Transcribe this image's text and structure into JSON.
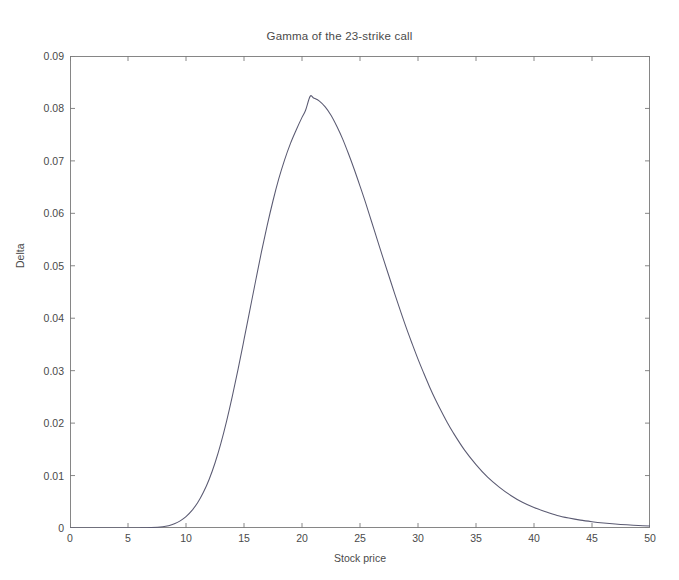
{
  "figure": {
    "background": "#ffffff",
    "axes_color": "#555555",
    "line_color": "#4a4a6a"
  },
  "chart_data": {
    "type": "line",
    "title": "Gamma of the 23-strike call",
    "xlabel": "Stock price",
    "ylabel": "Delta",
    "xlim": [
      0,
      50
    ],
    "ylim": [
      0,
      0.09
    ],
    "grid": false,
    "legend": null,
    "xticks": [
      0,
      5,
      10,
      15,
      20,
      25,
      30,
      35,
      40,
      45,
      50
    ],
    "xtick_labels": [
      "0",
      "5",
      "10",
      "15",
      "20",
      "25",
      "30",
      "35",
      "40",
      "45",
      "50"
    ],
    "yticks": [
      0,
      0.01,
      0.02,
      0.03,
      0.04,
      0.05,
      0.06,
      0.07,
      0.08,
      0.09
    ],
    "ytick_labels": [
      "0",
      "0.01",
      "0.02",
      "0.03",
      "0.04",
      "0.05",
      "0.06",
      "0.07",
      "0.08",
      "0.09"
    ],
    "annotations": {
      "peak_x": 20.7,
      "peak_y": 0.0823
    },
    "series": [
      {
        "name": "Gamma",
        "x": [
          0,
          1,
          2,
          3,
          4,
          5,
          6,
          7,
          8,
          8.5,
          9,
          9.5,
          10,
          10.5,
          11,
          11.5,
          12,
          12.5,
          13,
          13.5,
          14,
          14.5,
          15,
          15.5,
          16,
          16.5,
          17,
          17.5,
          18,
          18.5,
          19,
          19.5,
          20,
          20.3,
          20.7,
          21,
          21.5,
          22,
          22.5,
          23,
          23.5,
          24,
          24.5,
          25,
          25.5,
          26,
          26.5,
          27,
          27.5,
          28,
          28.5,
          29,
          29.5,
          30,
          30.5,
          31,
          31.5,
          32,
          32.5,
          33,
          34,
          35,
          36,
          37,
          38,
          39,
          40,
          41,
          42,
          43,
          44,
          45,
          46,
          47,
          48,
          49,
          50
        ],
        "y": [
          0,
          0,
          0,
          0,
          0,
          0,
          2e-05,
          8e-05,
          0.00025,
          0.00045,
          0.0008,
          0.00135,
          0.00215,
          0.0033,
          0.0048,
          0.0068,
          0.0093,
          0.0124,
          0.0161,
          0.0204,
          0.0252,
          0.0304,
          0.0359,
          0.0415,
          0.0471,
          0.0526,
          0.0577,
          0.0624,
          0.0666,
          0.0702,
          0.0733,
          0.0759,
          0.0783,
          0.0796,
          0.0823,
          0.082,
          0.0814,
          0.0803,
          0.0787,
          0.0766,
          0.0742,
          0.0714,
          0.0684,
          0.0652,
          0.0619,
          0.0584,
          0.0549,
          0.0514,
          0.048,
          0.0446,
          0.0413,
          0.0381,
          0.0351,
          0.0322,
          0.0295,
          0.0269,
          0.0245,
          0.0223,
          0.0202,
          0.0183,
          0.0149,
          0.0121,
          0.0097,
          0.0078,
          0.0062,
          0.0049,
          0.0039,
          0.0031,
          0.0024,
          0.0019,
          0.0015,
          0.0012,
          0.00095,
          0.00075,
          0.0006,
          0.00048,
          0.00038
        ]
      }
    ]
  }
}
